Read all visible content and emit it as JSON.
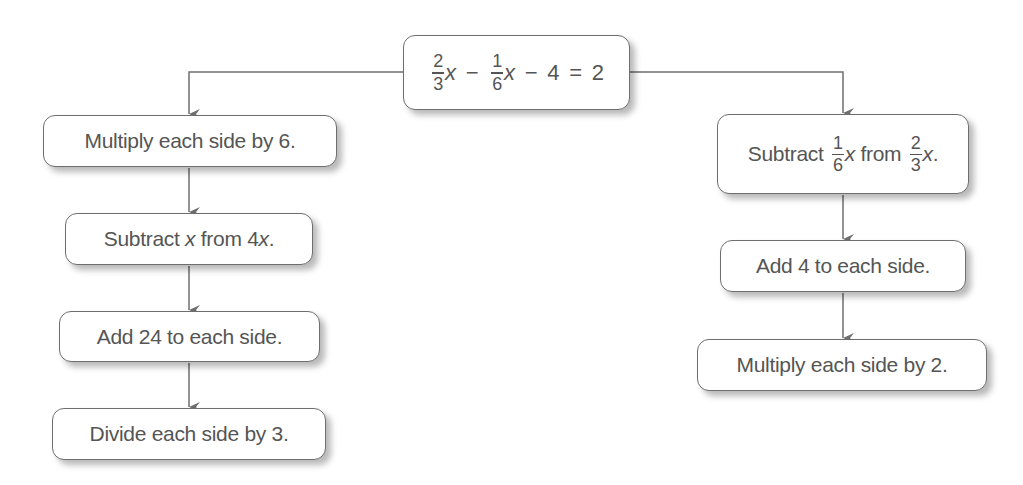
{
  "diagram": {
    "root": {
      "equation": {
        "term1": {
          "numerator": "2",
          "denominator": "3",
          "variable": "x"
        },
        "op1": "−",
        "term2": {
          "numerator": "1",
          "denominator": "6",
          "variable": "x"
        },
        "op2": "−",
        "constant": "4",
        "equals": "=",
        "rhs": "2"
      }
    },
    "left_branch": {
      "steps": [
        {
          "label": "Multiply each side by 6."
        },
        {
          "prefix": "Subtract ",
          "var1": "x",
          "middle": " from 4",
          "var2": "x",
          "suffix": "."
        },
        {
          "label": "Add 24 to each side."
        },
        {
          "label": "Divide each side by 3."
        }
      ]
    },
    "right_branch": {
      "steps": [
        {
          "prefix": "Subtract ",
          "frac1": {
            "numerator": "1",
            "denominator": "6"
          },
          "var1": "x",
          "middle": " from ",
          "frac2": {
            "numerator": "2",
            "denominator": "3"
          },
          "var2": "x",
          "suffix": "."
        },
        {
          "label": "Add 4 to each side."
        },
        {
          "label": "Multiply each side by 2."
        }
      ]
    },
    "colors": {
      "line": "#6e6e6e",
      "text": "#555555",
      "box_fill": "#ffffff"
    }
  }
}
